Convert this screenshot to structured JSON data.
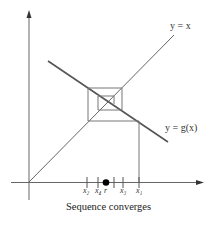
{
  "diagram": {
    "type": "cobweb-fixed-point-iteration",
    "curves": {
      "identity_label": "y = x",
      "g_label": "y = g(x)"
    },
    "ticks": {
      "x2": "x₂",
      "x4": "x₄",
      "r": "r",
      "x3": "x₃",
      "x1": "x₁"
    },
    "caption": "Sequence converges",
    "colors": {
      "line": "#555555",
      "thick_line": "#444444",
      "point": "#000000"
    }
  }
}
